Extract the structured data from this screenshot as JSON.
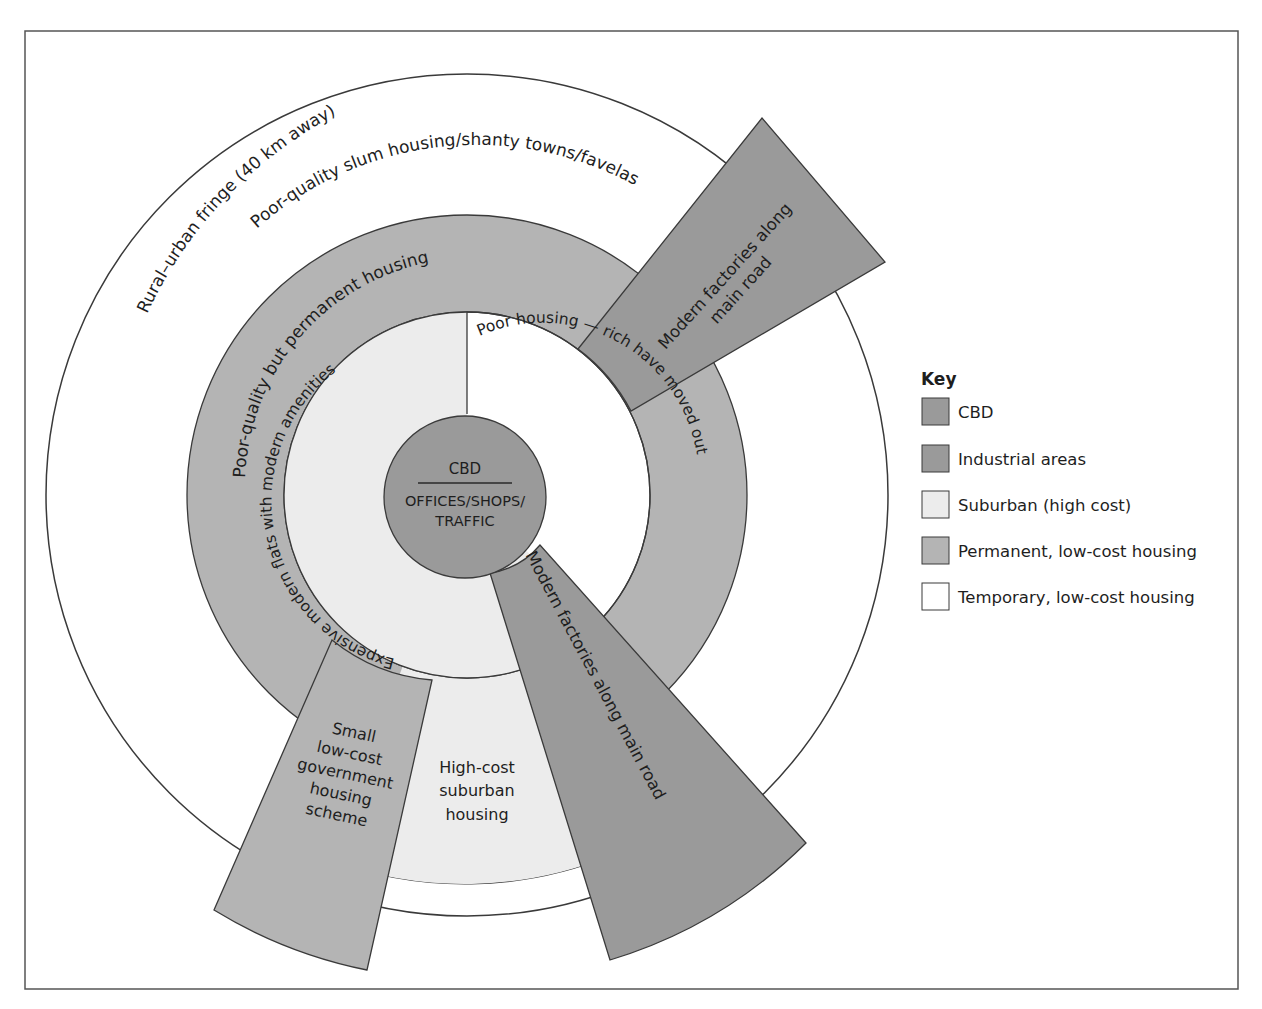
{
  "diagram": {
    "colors": {
      "cbd": "#9a9a9a",
      "industrial": "#9a9a9a",
      "suburban": "#ececec",
      "permanent": "#b4b4b4",
      "temporary": "#ffffff",
      "stroke": "#3a3a3a"
    },
    "zones": {
      "outer_ring": "Rural–urban fringe (40 km away)",
      "slum_ring": "Poor-quality slum housing/shanty towns/favelas",
      "permanent_ring": "Poor-quality but permanent housing",
      "suburban_left": "Expensive modern flats with modern amenities",
      "suburban_right": "Poor housing — rich have moved out",
      "cbd_top": "CBD",
      "cbd_line1": "OFFICES/SHOPS/",
      "cbd_line2": "TRAFFIC",
      "factory_ne_line1": "Modern factories along",
      "factory_ne_line2": "main road",
      "factory_se": "Modern factories along main road",
      "gov_housing": [
        "Small",
        "low-cost",
        "government",
        "housing",
        "scheme"
      ],
      "high_cost": [
        "High-cost",
        "suburban",
        "housing"
      ]
    }
  },
  "key": {
    "title": "Key",
    "items": [
      {
        "label": "CBD",
        "color": "#9a9a9a"
      },
      {
        "label": "Industrial areas",
        "color": "#9a9a9a"
      },
      {
        "label": "Suburban (high cost)",
        "color": "#ececec"
      },
      {
        "label": "Permanent, low-cost housing",
        "color": "#b4b4b4"
      },
      {
        "label": "Temporary, low-cost housing",
        "color": "#ffffff"
      }
    ]
  }
}
